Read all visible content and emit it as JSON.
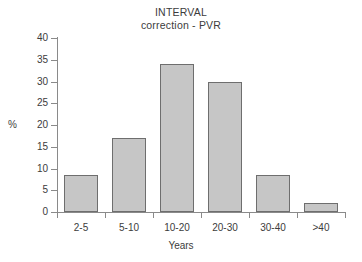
{
  "chart_data": {
    "type": "bar",
    "title": "INTERVAL correction - PVR",
    "title_lines": [
      "INTERVAL",
      "correction - PVR"
    ],
    "categories": [
      "2-5",
      "5-10",
      "10-20",
      "20-30",
      "30-40",
      ">40"
    ],
    "values": [
      8.5,
      17,
      34,
      30,
      8.5,
      2
    ],
    "xlabel": "Years",
    "ylabel": "%",
    "ylim": [
      0,
      40
    ],
    "ytick_step": 5,
    "yticks": [
      "40",
      "35",
      "30",
      "25",
      "20",
      "15",
      "10",
      "5",
      "0"
    ],
    "ytick_values": [
      40,
      35,
      30,
      25,
      20,
      15,
      10,
      5,
      0
    ],
    "grid": false,
    "legend": null,
    "bar_fill_color": "#c6c6c6",
    "bar_border_color": "#6e6e6e",
    "axis_color": "#8a8a8a",
    "background_color": "#ffffff",
    "text_color": "#3c3c3c"
  }
}
